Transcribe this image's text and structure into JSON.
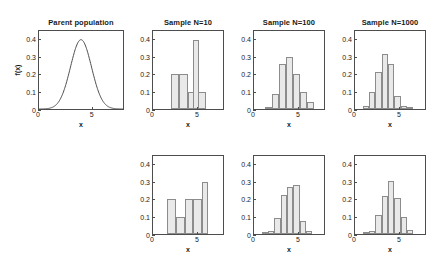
{
  "figure": {
    "width": 430,
    "height": 255,
    "background": "#ffffff",
    "axis_color": "#4d4d4d",
    "bar_fill": "#e9e9e9",
    "bar_edge": "#8c8c8c"
  },
  "axes": {
    "ylim": [
      0,
      0.45
    ],
    "xlim": [
      0,
      8
    ],
    "yticks": [
      0,
      0.1,
      0.2,
      0.3,
      0.4
    ],
    "ytick_labels": [
      "0",
      "0.1",
      "0.2",
      "0.3",
      "0.4"
    ],
    "xticks": [
      0,
      5
    ],
    "xtick_labels": [
      "0",
      "5"
    ],
    "xlabel": "x",
    "ylabel": "f(x)",
    "grid": false
  },
  "chart_data": [
    {
      "id": "parent-population",
      "type": "line",
      "title": "Parent population",
      "xlabel": "x",
      "ylabel": "f(x)",
      "xlim": [
        0,
        8
      ],
      "ylim": [
        0,
        0.45
      ],
      "distribution": "normal",
      "mean": 4,
      "sd": 1,
      "peak": 0.4,
      "x": [
        0,
        0.5,
        1,
        1.5,
        2,
        2.5,
        3,
        3.5,
        4,
        4.5,
        5,
        5.5,
        6,
        6.5,
        7,
        7.5,
        8
      ],
      "y": [
        0.0001,
        0.0009,
        0.0044,
        0.0175,
        0.054,
        0.1295,
        0.242,
        0.3521,
        0.3989,
        0.3521,
        0.242,
        0.1295,
        0.054,
        0.0175,
        0.0044,
        0.0009,
        0.0001
      ]
    },
    {
      "id": "sample-n10-a",
      "type": "bar",
      "title": "Sample N=10",
      "xlabel": "x",
      "xlim": [
        0,
        8
      ],
      "ylim": [
        0,
        0.45
      ],
      "bin_width": 1,
      "bin_starts": [
        2,
        3,
        4,
        5
      ],
      "categories": [
        "2",
        "3",
        "4",
        "5"
      ],
      "values": [
        0.2,
        0.2,
        0.1,
        0.1
      ],
      "spike": {
        "bin_start": 4.6,
        "bin_width": 0.62,
        "value": 0.4
      }
    },
    {
      "id": "sample-n100-a",
      "type": "bar",
      "title": "Sample N=100",
      "xlabel": "x",
      "xlim": [
        0,
        8
      ],
      "ylim": [
        0,
        0.45
      ],
      "bin_width": 0.8,
      "bin_starts": [
        1.2,
        2.0,
        2.8,
        3.6,
        4.4,
        5.2,
        6.0
      ],
      "categories": [
        "1.2",
        "2.0",
        "2.8",
        "3.6",
        "4.4",
        "5.2",
        "6.0"
      ],
      "values": [
        0.01,
        0.085,
        0.26,
        0.3,
        0.2,
        0.1,
        0.04
      ]
    },
    {
      "id": "sample-n1000-a",
      "type": "bar",
      "title": "Sample N=1000",
      "xlabel": "x",
      "xlim": [
        0,
        8
      ],
      "ylim": [
        0,
        0.45
      ],
      "bin_width": 0.72,
      "bin_starts": [
        0.9,
        1.62,
        2.34,
        3.06,
        3.78,
        4.5,
        5.22,
        5.94
      ],
      "categories": [
        "0.9",
        "1.6",
        "2.3",
        "3.1",
        "3.8",
        "4.5",
        "5.2",
        "5.9"
      ],
      "values": [
        0.015,
        0.1,
        0.215,
        0.315,
        0.26,
        0.075,
        0.02,
        0.003
      ]
    },
    {
      "id": "sample-n10-b",
      "type": "bar",
      "title": "",
      "xlabel": "x",
      "xlim": [
        0,
        8
      ],
      "ylim": [
        0,
        0.45
      ],
      "bin_width": 1,
      "bin_starts": [
        1.6,
        2.6,
        3.6,
        4.6
      ],
      "categories": [
        "1.6",
        "2.6",
        "3.6",
        "4.6"
      ],
      "values": [
        0.2,
        0.1,
        0.2,
        0.2
      ],
      "spike": {
        "bin_start": 5.6,
        "bin_width": 0.72,
        "value": 0.3
      }
    },
    {
      "id": "sample-n100-b",
      "type": "bar",
      "title": "",
      "xlabel": "x",
      "xlim": [
        0,
        8
      ],
      "ylim": [
        0,
        0.45
      ],
      "bin_width": 0.72,
      "bin_starts": [
        0.9,
        1.62,
        2.34,
        3.06,
        3.78,
        4.5,
        5.22,
        5.94
      ],
      "categories": [
        "0.9",
        "1.6",
        "2.3",
        "3.1",
        "3.8",
        "4.5",
        "5.2",
        "5.9"
      ],
      "values": [
        0.01,
        0.02,
        0.09,
        0.225,
        0.27,
        0.28,
        0.075,
        0.015
      ]
    },
    {
      "id": "sample-n1000-b",
      "type": "bar",
      "title": "",
      "xlabel": "x",
      "xlim": [
        0,
        8
      ],
      "ylim": [
        0,
        0.45
      ],
      "bin_width": 0.72,
      "bin_starts": [
        0.9,
        1.62,
        2.34,
        3.06,
        3.78,
        4.5,
        5.22,
        5.94
      ],
      "categories": [
        "0.9",
        "1.6",
        "2.3",
        "3.1",
        "3.8",
        "4.5",
        "5.2",
        "5.9"
      ],
      "values": [
        0.008,
        0.02,
        0.11,
        0.22,
        0.305,
        0.21,
        0.1,
        0.025
      ]
    }
  ],
  "layout": {
    "panels": [
      {
        "id": "parent-population",
        "row": 0,
        "col": 0,
        "left": 38,
        "top": 30,
        "width": 86,
        "height": 80
      },
      {
        "id": "sample-n10-a",
        "row": 0,
        "col": 1,
        "left": 152,
        "top": 30,
        "width": 72,
        "height": 80
      },
      {
        "id": "sample-n100-a",
        "row": 0,
        "col": 2,
        "left": 253,
        "top": 30,
        "width": 72,
        "height": 80
      },
      {
        "id": "sample-n1000-a",
        "row": 0,
        "col": 3,
        "left": 354,
        "top": 30,
        "width": 72,
        "height": 80
      },
      {
        "id": "sample-n10-b",
        "row": 1,
        "col": 1,
        "left": 152,
        "top": 155,
        "width": 72,
        "height": 80
      },
      {
        "id": "sample-n100-b",
        "row": 1,
        "col": 2,
        "left": 253,
        "top": 155,
        "width": 72,
        "height": 80
      },
      {
        "id": "sample-n1000-b",
        "row": 1,
        "col": 3,
        "left": 354,
        "top": 155,
        "width": 72,
        "height": 80
      }
    ]
  }
}
